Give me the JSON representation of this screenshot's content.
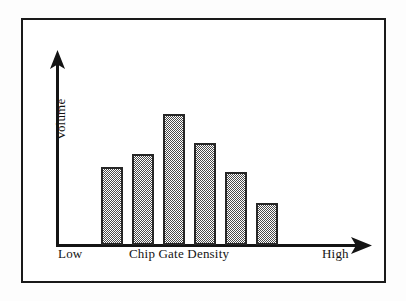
{
  "figure": {
    "frame_color": "#1a1a1a",
    "background": "#ffffff"
  },
  "axes": {
    "y_axis_label": "Volume",
    "x_axis_title": "Chip Gate Density",
    "x_axis_low_label": "Low",
    "x_axis_high_label": "High",
    "y_arrow_name": "up-arrow-icon",
    "x_arrow_name": "right-arrow-icon"
  },
  "chart_data": {
    "type": "bar",
    "title": "",
    "xlabel": "Chip Gate Density",
    "ylabel": "Volume",
    "categories": [
      "1",
      "2",
      "3",
      "4",
      "5",
      "6"
    ],
    "values": [
      62,
      72,
      104,
      81,
      58,
      33
    ],
    "ylim": [
      0,
      120
    ],
    "xlim_labels": [
      "Low",
      "High"
    ],
    "grid": false,
    "legend": null,
    "bar_fill": "50% checkerboard dither gray",
    "bar_fill_color": "#4a4a4a",
    "bar_outline_color": "#262626",
    "axis_color": "#141414"
  }
}
